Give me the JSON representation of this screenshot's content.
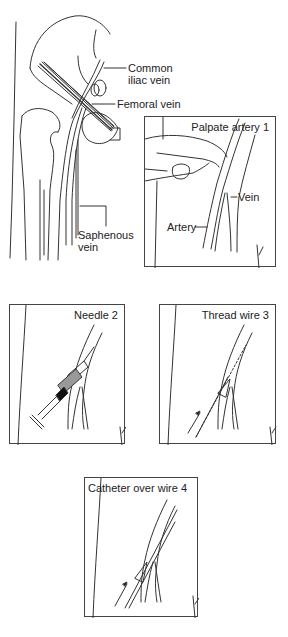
{
  "figure": {
    "anatomy": {
      "labels": {
        "common_iliac": [
          "Common",
          "iliac vein"
        ],
        "femoral": "Femoral vein",
        "saphenous": [
          "Saphenous",
          "vein"
        ]
      }
    },
    "panels": [
      {
        "step": 1,
        "title": "Palpate artery 1",
        "labels": {
          "vein": "Vein",
          "artery": "Artery"
        }
      },
      {
        "step": 2,
        "title": "Needle 2"
      },
      {
        "step": 3,
        "title": "Thread wire 3"
      },
      {
        "step": 4,
        "title": "Catheter over wire 4"
      }
    ],
    "colors": {
      "line": "#333333",
      "background": "#ffffff",
      "syringe_fill": "#999999"
    }
  }
}
